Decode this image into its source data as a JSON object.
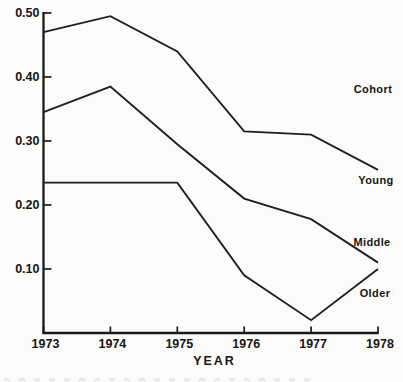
{
  "chart_data": {
    "type": "line",
    "title": "",
    "xlabel": "YEAR",
    "ylabel": "",
    "x": [
      1973,
      1974,
      1975,
      1976,
      1977,
      1978
    ],
    "x_tick_labels": [
      "1973",
      "1974",
      "1975",
      "1976",
      "1977",
      "1978"
    ],
    "y_ticks": [
      0.5,
      0.4,
      0.3,
      0.2,
      0.1
    ],
    "y_tick_labels": [
      "0.50",
      "0.40",
      "0.30",
      "0.20",
      "0.10"
    ],
    "ylim": [
      0,
      0.52
    ],
    "xlim": [
      1973,
      1978
    ],
    "grid": false,
    "legend_header": "Cohort",
    "legend_position": "right-of-lines",
    "series": [
      {
        "name": "Young",
        "values": [
          0.47,
          0.495,
          0.44,
          0.315,
          0.31,
          0.255
        ]
      },
      {
        "name": "Middle",
        "values": [
          0.345,
          0.385,
          0.295,
          0.21,
          0.178,
          0.11
        ]
      },
      {
        "name": "Older",
        "values": [
          0.235,
          0.235,
          0.235,
          0.09,
          0.02,
          0.1
        ]
      }
    ],
    "line_color": "#1f1f1f",
    "axis_color": "#1a1a1a",
    "text_color": "#161616",
    "background": "#fbfbf9"
  }
}
